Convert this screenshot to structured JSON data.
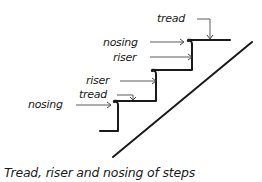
{
  "diagram": {
    "caption": "Tread, riser and nosing of steps",
    "labels": {
      "tread_top": "tread",
      "nosing_upper": "nosing",
      "riser_upper": "riser",
      "riser_lower": "riser",
      "tread_lower": "tread",
      "nosing_lower": "nosing"
    },
    "colors": {
      "stroke": "#1a1a1a",
      "leader": "#333333",
      "background": "#ffffff"
    }
  }
}
